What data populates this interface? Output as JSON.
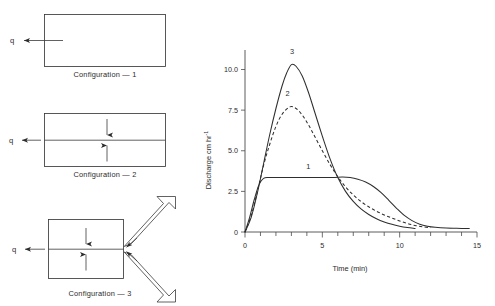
{
  "figure": {
    "left_panel": {
      "name": "configuration-diagrams",
      "flow_symbol": "q",
      "configurations": [
        {
          "id": "configuration-1",
          "caption": "Configuration — 1",
          "description": "single plane rectangle with lateral outflow",
          "has_midline": false,
          "has_vertical_arrows": false,
          "has_chevron": false
        },
        {
          "id": "configuration-2",
          "caption": "Configuration — 2",
          "description": "rectangle split by central channel with converging vertical inflow",
          "has_midline": true,
          "has_vertical_arrows": true,
          "has_chevron": false
        },
        {
          "id": "configuration-3",
          "caption": "Configuration — 3",
          "description": "rectangle with central channel fed by converging V-shaped side planes",
          "has_midline": true,
          "has_vertical_arrows": true,
          "has_chevron": true
        }
      ]
    }
  },
  "chart_data": {
    "type": "line",
    "title": "",
    "xlabel": "Time (min)",
    "ylabel": "Discharge cm hr",
    "ylabel_exponent": "-1",
    "xlim": [
      0,
      15
    ],
    "ylim": [
      0,
      11.2
    ],
    "xticks": [
      0,
      5,
      10,
      15
    ],
    "xtick_labels": [
      "0",
      "5",
      "10",
      "15"
    ],
    "xminor_step": 1,
    "yticks": [
      0,
      2.5,
      5.0,
      7.5,
      10.0
    ],
    "ytick_labels": [
      "0",
      "2.5",
      "5.0",
      "7.5",
      "10.0"
    ],
    "grid": false,
    "legend": "inline-curve-labels",
    "series": [
      {
        "name": "1",
        "label": "1",
        "style": "solid",
        "peak_value": 3.35,
        "peak_time": 6.5,
        "points": [
          [
            0.0,
            0.0
          ],
          [
            0.3,
            0.9
          ],
          [
            0.6,
            2.0
          ],
          [
            0.9,
            2.9
          ],
          [
            1.2,
            3.3
          ],
          [
            1.6,
            3.35
          ],
          [
            2.5,
            3.35
          ],
          [
            3.5,
            3.35
          ],
          [
            4.5,
            3.35
          ],
          [
            5.2,
            3.35
          ],
          [
            5.8,
            3.36
          ],
          [
            6.3,
            3.38
          ],
          [
            6.8,
            3.35
          ],
          [
            7.3,
            3.25
          ],
          [
            7.8,
            3.08
          ],
          [
            8.3,
            2.8
          ],
          [
            8.8,
            2.42
          ],
          [
            9.3,
            1.95
          ],
          [
            9.8,
            1.46
          ],
          [
            10.3,
            1.02
          ],
          [
            10.8,
            0.7
          ],
          [
            11.3,
            0.48
          ],
          [
            11.8,
            0.36
          ],
          [
            12.3,
            0.29
          ],
          [
            13.0,
            0.24
          ],
          [
            14.0,
            0.22
          ],
          [
            14.5,
            0.21
          ]
        ]
      },
      {
        "name": "2",
        "label": "2",
        "style": "dashed",
        "peak_value": 7.7,
        "peak_time": 2.9,
        "points": [
          [
            0.0,
            0.0
          ],
          [
            0.4,
            1.0
          ],
          [
            0.8,
            2.5
          ],
          [
            1.2,
            4.1
          ],
          [
            1.6,
            5.4
          ],
          [
            2.0,
            6.5
          ],
          [
            2.4,
            7.25
          ],
          [
            2.9,
            7.7
          ],
          [
            3.3,
            7.6
          ],
          [
            3.7,
            7.2
          ],
          [
            4.1,
            6.6
          ],
          [
            4.5,
            5.9
          ],
          [
            5.0,
            5.0
          ],
          [
            5.5,
            4.15
          ],
          [
            6.0,
            3.4
          ],
          [
            6.5,
            2.78
          ],
          [
            7.0,
            2.28
          ],
          [
            7.5,
            1.88
          ],
          [
            8.0,
            1.55
          ],
          [
            8.5,
            1.28
          ],
          [
            9.0,
            1.05
          ],
          [
            9.5,
            0.86
          ],
          [
            10.0,
            0.68
          ],
          [
            10.5,
            0.52
          ],
          [
            11.0,
            0.4
          ],
          [
            11.5,
            0.32
          ],
          [
            12.0,
            0.27
          ]
        ]
      },
      {
        "name": "3",
        "label": "3",
        "style": "solid",
        "peak_value": 10.3,
        "peak_time": 3.0,
        "points": [
          [
            0.0,
            0.0
          ],
          [
            0.4,
            0.9
          ],
          [
            0.8,
            2.4
          ],
          [
            1.2,
            4.2
          ],
          [
            1.6,
            6.0
          ],
          [
            2.0,
            7.6
          ],
          [
            2.4,
            9.0
          ],
          [
            2.7,
            9.8
          ],
          [
            3.0,
            10.3
          ],
          [
            3.3,
            10.2
          ],
          [
            3.7,
            9.6
          ],
          [
            4.1,
            8.6
          ],
          [
            4.5,
            7.4
          ],
          [
            5.0,
            5.9
          ],
          [
            5.5,
            4.5
          ],
          [
            6.0,
            3.35
          ],
          [
            6.5,
            2.5
          ],
          [
            7.0,
            1.88
          ],
          [
            7.5,
            1.42
          ],
          [
            8.0,
            1.08
          ],
          [
            8.5,
            0.82
          ],
          [
            9.0,
            0.62
          ],
          [
            9.5,
            0.47
          ],
          [
            10.0,
            0.36
          ],
          [
            10.5,
            0.28
          ],
          [
            11.0,
            0.22
          ]
        ]
      }
    ],
    "curve_labels": [
      {
        "text": "3",
        "x": 3.05,
        "y": 10.95
      },
      {
        "text": "2",
        "x": 2.75,
        "y": 8.35
      },
      {
        "text": "1",
        "x": 4.1,
        "y": 3.85
      }
    ]
  },
  "colors": {
    "ink": "#2e2e2e",
    "axis": "#4a4a4a",
    "diagram_stroke": "#3a3a3a",
    "background": "#ffffff"
  }
}
